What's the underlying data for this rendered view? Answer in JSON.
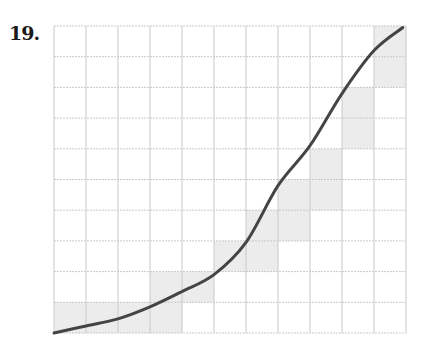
{
  "exercise": {
    "number_label": "19."
  },
  "colors": {
    "grid": "#c9c9c9",
    "shade": "#ececec",
    "curve": "#444444"
  },
  "chart_data": {
    "type": "line",
    "title": "",
    "xlabel": "",
    "ylabel": "",
    "grid": true,
    "grid_columns": 11,
    "grid_rows": 10,
    "xlim": [
      0,
      11
    ],
    "ylim": [
      0,
      10
    ],
    "series": [
      {
        "name": "curve",
        "x": [
          0,
          1,
          2,
          3,
          4,
          5,
          6,
          7,
          8,
          9,
          10,
          10.9
        ],
        "y": [
          0,
          0.23,
          0.46,
          0.85,
          1.35,
          1.9,
          2.95,
          4.8,
          6.1,
          7.8,
          9.2,
          9.95
        ]
      }
    ],
    "shaded_cells": [
      {
        "col": 0,
        "row_from_bottom": 0
      },
      {
        "col": 1,
        "row_from_bottom": 0
      },
      {
        "col": 2,
        "row_from_bottom": 0
      },
      {
        "col": 3,
        "row_from_bottom": 0
      },
      {
        "col": 3,
        "row_from_bottom": 1
      },
      {
        "col": 4,
        "row_from_bottom": 1
      },
      {
        "col": 5,
        "row_from_bottom": 2
      },
      {
        "col": 6,
        "row_from_bottom": 2
      },
      {
        "col": 6,
        "row_from_bottom": 3
      },
      {
        "col": 7,
        "row_from_bottom": 3
      },
      {
        "col": 7,
        "row_from_bottom": 4
      },
      {
        "col": 8,
        "row_from_bottom": 4
      },
      {
        "col": 8,
        "row_from_bottom": 5
      },
      {
        "col": 9,
        "row_from_bottom": 6
      },
      {
        "col": 9,
        "row_from_bottom": 7
      },
      {
        "col": 10,
        "row_from_bottom": 8
      },
      {
        "col": 10,
        "row_from_bottom": 9
      }
    ]
  }
}
